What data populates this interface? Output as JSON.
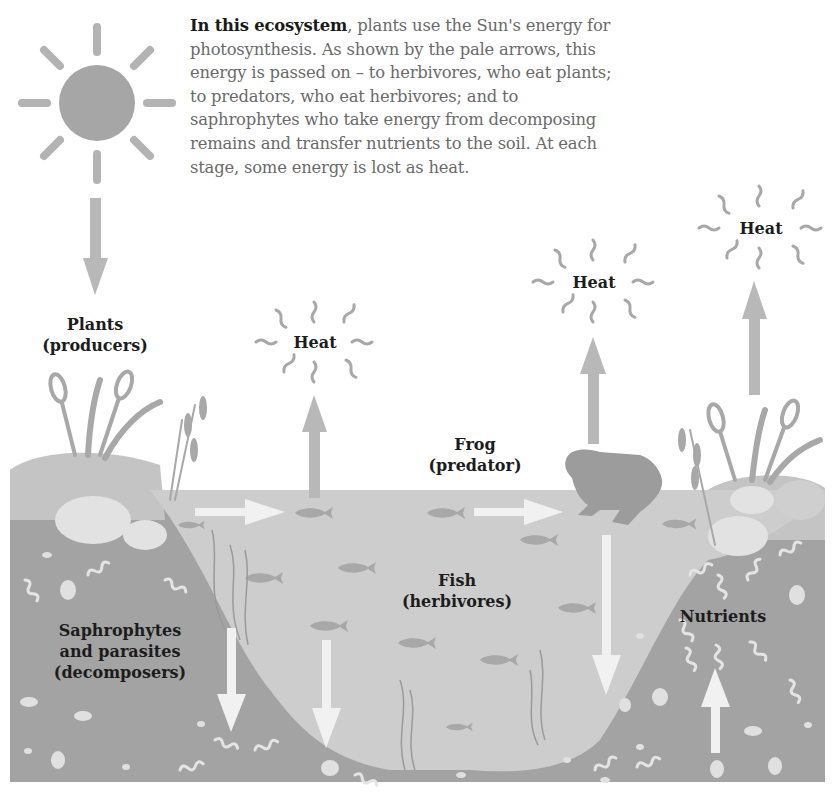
{
  "intro": {
    "lead": "In this ecosystem",
    "body": ", plants use the Sun's energy for photosynthesis. As shown by the pale arrows, this energy is passed on – to herbivores, who eat plants; to predators, who eat herbivores; and to saphrophytes who take energy from decomposing remains and transfer nutrients to the soil. At each stage, some energy is lost as heat."
  },
  "labels": {
    "plants": {
      "line1": "Plants",
      "line2": "(producers)"
    },
    "frog": {
      "line1": "Frog",
      "line2": "(predator)"
    },
    "fish": {
      "line1": "Fish",
      "line2": "(herbivores)"
    },
    "decomposers": {
      "line1": "Saphrophytes",
      "line2": "and parasites",
      "line3": "(decomposers)"
    },
    "nutrients": "Nutrients",
    "heat": [
      "Heat",
      "Heat",
      "Heat"
    ]
  },
  "icons": {
    "sun": "sun-icon",
    "frog": "frog-icon",
    "fish": "fish-icon",
    "plants": "cattail-icon",
    "arrow_energy": "pale-arrow-icon",
    "arrow_heat": "grey-arrow-icon",
    "heat_waves": "heat-squiggle-icon"
  },
  "colors": {
    "background": "#ffffff",
    "sun": "#a6a6a6",
    "grey_arrow": "#b8b8b8",
    "pale_arrow": "#f1f1f1",
    "water": "#cdcdcd",
    "soil": "#a3a3a3",
    "bank_top": "#c4c4c4",
    "stones": "#e2e2e2",
    "creature": "#9c9c9c",
    "text_dark": "#1c1c1c",
    "text_body": "#6a6a6a"
  }
}
